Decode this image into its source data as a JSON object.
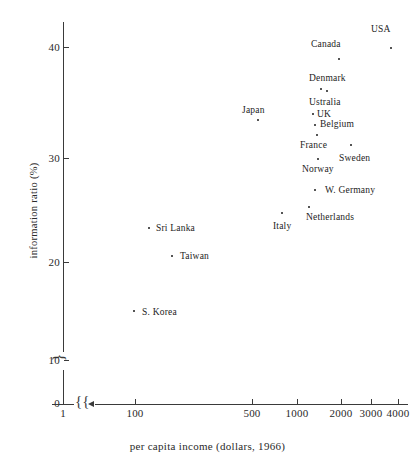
{
  "chart_data": {
    "type": "scatter",
    "title": "",
    "xlabel": "per capita income (dollars, 1966)",
    "ylabel": "information ratio (%)",
    "xscale": "log",
    "xlim": [
      1,
      4000
    ],
    "ylim": [
      0,
      42
    ],
    "grid": false,
    "legend": "none",
    "axis_breaks": {
      "x": "break between 1 and 100",
      "y": "break between 0 and 10"
    },
    "xticks": [
      {
        "label": "1",
        "value": 1
      },
      {
        "label": "100",
        "value": 100
      },
      {
        "label": "500",
        "value": 500
      },
      {
        "label": "1000",
        "value": 1000
      },
      {
        "label": "2000",
        "value": 2000
      },
      {
        "label": "3000",
        "value": 3000
      },
      {
        "label": "4000",
        "value": 4000
      }
    ],
    "yticks": [
      {
        "label": "0",
        "value": 0
      },
      {
        "label": "10",
        "value": 10
      },
      {
        "label": "20",
        "value": 20
      },
      {
        "label": "30",
        "value": 30
      },
      {
        "label": "40",
        "value": 40
      }
    ],
    "points": [
      {
        "label": "USA",
        "x": 3300,
        "y": 40.3,
        "px": 390,
        "py": 47,
        "lx": 371,
        "ly": 24,
        "label_align": "above"
      },
      {
        "label": "Canada",
        "x": 2100,
        "y": 39.2,
        "px": 338,
        "py": 58,
        "lx": 311,
        "ly": 39,
        "label_align": "above"
      },
      {
        "label": "Denmark",
        "x": 1750,
        "y": 36.4,
        "px": 326,
        "py": 90,
        "lx": 309,
        "ly": 73,
        "label_align": "above"
      },
      {
        "label": "Ustralia",
        "x": 1600,
        "y": 36.6,
        "px": 320,
        "py": 88,
        "lx": 309,
        "ly": 97,
        "label_align": "below"
      },
      {
        "label": "UK",
        "x": 1650,
        "y": 34.2,
        "px": 312,
        "py": 113,
        "lx": 317,
        "ly": 109,
        "label_align": "right"
      },
      {
        "label": "Belgium",
        "x": 1700,
        "y": 33.2,
        "px": 314,
        "py": 124,
        "lx": 320,
        "ly": 119,
        "label_align": "right"
      },
      {
        "label": "Japan",
        "x": 620,
        "y": 33.6,
        "px": 257,
        "py": 119,
        "lx": 242,
        "ly": 105,
        "label_align": "above"
      },
      {
        "label": "France",
        "x": 1700,
        "y": 32.3,
        "px": 316,
        "py": 134,
        "lx": 300,
        "ly": 140,
        "label_align": "below-left"
      },
      {
        "label": "Sweden",
        "x": 2600,
        "y": 31.4,
        "px": 350,
        "py": 144,
        "lx": 339,
        "ly": 153,
        "label_align": "below"
      },
      {
        "label": "Norway",
        "x": 1700,
        "y": 30.0,
        "px": 317,
        "py": 158,
        "lx": 302,
        "ly": 164,
        "label_align": "below"
      },
      {
        "label": "W. Germany",
        "x": 2050,
        "y": 27.2,
        "px": 314,
        "py": 189,
        "lx": 325,
        "ly": 185,
        "label_align": "right"
      },
      {
        "label": "Netherlands",
        "x": 1850,
        "y": 25.2,
        "px": 308,
        "py": 206,
        "lx": 306,
        "ly": 212,
        "label_align": "below"
      },
      {
        "label": "Italy",
        "x": 1000,
        "y": 24.3,
        "px": 281,
        "py": 212,
        "lx": 273,
        "ly": 221,
        "label_align": "below"
      },
      {
        "label": "Sri Lanka",
        "x": 155,
        "y": 23.5,
        "px": 148,
        "py": 227,
        "lx": 156,
        "ly": 223,
        "label_align": "right"
      },
      {
        "label": "Taiwan",
        "x": 230,
        "y": 21.2,
        "px": 171,
        "py": 255,
        "lx": 180,
        "ly": 251,
        "label_align": "right"
      },
      {
        "label": "S. Korea",
        "x": 105,
        "y": 15.5,
        "px": 133,
        "py": 310,
        "lx": 142,
        "ly": 307,
        "label_align": "right"
      }
    ]
  },
  "axes": {
    "x_title": "per capita income (dollars, 1966)",
    "y_title": "information ratio (%)"
  }
}
